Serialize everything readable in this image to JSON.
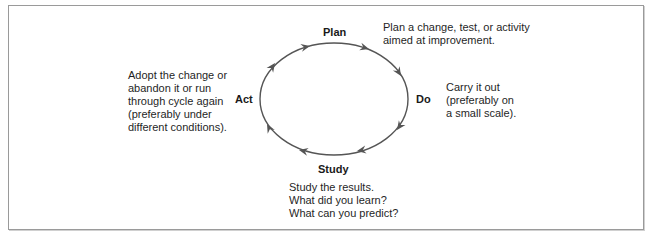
{
  "diagram": {
    "stages": {
      "plan": {
        "label": "Plan",
        "description": [
          "Plan a change, test, or activity",
          "aimed at improvement."
        ]
      },
      "do": {
        "label": "Do",
        "description": [
          "Carry it out",
          "(preferably on",
          "a small scale)."
        ]
      },
      "study": {
        "label": "Study",
        "description": [
          "Study the results.",
          "What did you learn?",
          "What can you predict?"
        ]
      },
      "act": {
        "label": "Act",
        "description": [
          "Adopt the change or",
          "abandon it or run",
          "through cycle again",
          "(preferably under",
          "different conditions)."
        ]
      }
    },
    "colors": {
      "cycle_line": "#555555",
      "border": "#9a9a9a",
      "text": "#1a1a1a"
    }
  }
}
